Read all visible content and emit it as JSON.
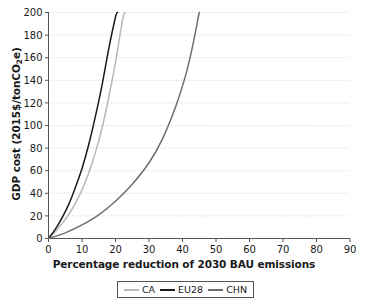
{
  "chart_data": {
    "type": "line",
    "title": "",
    "xlabel": "Percentage reduction of 2030 BAU emissions",
    "ylabel": "GDP cost (2015$/tonCO2e)",
    "ylabel_prefix": "GDP cost (2015$/tonCO",
    "ylabel_sub": "2",
    "ylabel_suffix": "e)",
    "xlim": [
      0,
      90
    ],
    "ylim": [
      0,
      200
    ],
    "xticks": [
      0,
      10,
      20,
      30,
      40,
      50,
      60,
      70,
      80,
      90
    ],
    "yticks": [
      0,
      20,
      40,
      60,
      80,
      100,
      120,
      140,
      160,
      180,
      200
    ],
    "xtick_labels": [
      "0",
      "10",
      "20",
      "30",
      "40",
      "50",
      "60",
      "70",
      "80",
      "90"
    ],
    "ytick_labels": [
      "0",
      "20",
      "40",
      "60",
      "80",
      "100",
      "120",
      "140",
      "160",
      "180",
      "200"
    ],
    "grid": "horizontal-dotted",
    "legend_position": "bottom-center",
    "series": [
      {
        "name": "CA",
        "color": "#b9b9b9",
        "points": [
          [
            0,
            0
          ],
          [
            2,
            6
          ],
          [
            4,
            13
          ],
          [
            6,
            21
          ],
          [
            8,
            31
          ],
          [
            10,
            43
          ],
          [
            12,
            58
          ],
          [
            14,
            76
          ],
          [
            16,
            98
          ],
          [
            18,
            125
          ],
          [
            20,
            156
          ],
          [
            22,
            192
          ],
          [
            22.8,
            200
          ]
        ]
      },
      {
        "name": "EU28",
        "color": "#1a1a1a",
        "points": [
          [
            0,
            0
          ],
          [
            2,
            8
          ],
          [
            4,
            18
          ],
          [
            6,
            30
          ],
          [
            8,
            45
          ],
          [
            10,
            62
          ],
          [
            12,
            83
          ],
          [
            14,
            108
          ],
          [
            16,
            136
          ],
          [
            18,
            168
          ],
          [
            20,
            196
          ],
          [
            20.6,
            200
          ]
        ]
      },
      {
        "name": "CHN",
        "color": "#6e6e6e",
        "points": [
          [
            0,
            0
          ],
          [
            5,
            5
          ],
          [
            10,
            12
          ],
          [
            15,
            21
          ],
          [
            20,
            33
          ],
          [
            25,
            48
          ],
          [
            30,
            67
          ],
          [
            34,
            88
          ],
          [
            38,
            117
          ],
          [
            41,
            145
          ],
          [
            43,
            170
          ],
          [
            45,
            200
          ]
        ]
      }
    ]
  },
  "legend": {
    "items": [
      {
        "label": "CA",
        "color": "#b9b9b9"
      },
      {
        "label": "EU28",
        "color": "#1a1a1a"
      },
      {
        "label": "CHN",
        "color": "#6e6e6e"
      }
    ]
  }
}
